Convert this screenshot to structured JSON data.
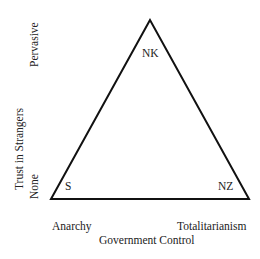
{
  "diagram": {
    "type": "triangle",
    "vertices": [
      {
        "id": "top",
        "label": "NK"
      },
      {
        "id": "bottom-left",
        "label": "S"
      },
      {
        "id": "bottom-right",
        "label": "NZ"
      }
    ],
    "x_axis": {
      "title": "Government Control",
      "min_label": "Anarchy",
      "max_label": "Totalitarianism"
    },
    "y_axis": {
      "title": "Trust in Strangers",
      "min_label": "None",
      "max_label": "Pervasive"
    }
  }
}
